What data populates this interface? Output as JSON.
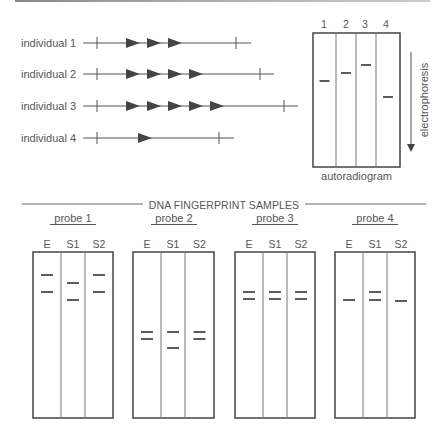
{
  "top_bar": {
    "color": "#999999"
  },
  "genotypes": {
    "rows": [
      {
        "label": "individual 1",
        "y": 43,
        "repeats": 3,
        "tick_start": 97,
        "tick_end": 236,
        "line_end": 251
      },
      {
        "label": "individual 2",
        "y": 74,
        "repeats": 4,
        "tick_start": 97,
        "tick_end": 260,
        "line_end": 274
      },
      {
        "label": "individual 3",
        "y": 106,
        "repeats": 5,
        "tick_start": 97,
        "tick_end": 284,
        "line_end": 298
      },
      {
        "label": "individual 4",
        "y": 138,
        "repeats": 1,
        "tick_start": 97,
        "tick_end": 219,
        "line_end": 234
      }
    ]
  },
  "autoradiogram": {
    "label": "autoradiogram",
    "lanes": [
      "1",
      "2",
      "3",
      "4"
    ],
    "band_y": [
      81,
      73,
      65,
      97
    ],
    "electrophoresis_label": "electrophoresis"
  },
  "samples": {
    "title": "DNA FINGERPRINT SAMPLES",
    "columns": [
      "E",
      "S1",
      "S2"
    ],
    "probes": [
      {
        "label": "probe 1",
        "bands": [
          [
            275,
            292
          ],
          [
            283,
            300
          ],
          [
            275,
            292
          ]
        ]
      },
      {
        "label": "probe 2",
        "bands": [
          [
            332,
            339
          ],
          [
            332,
            348
          ],
          [
            332,
            339
          ]
        ]
      },
      {
        "label": "probe 3",
        "bands": [
          [
            292,
            299
          ],
          [
            292,
            299
          ],
          [
            292,
            299
          ]
        ]
      },
      {
        "label": "probe 4",
        "bands": [
          [
            300
          ],
          [
            292,
            300
          ],
          [
            301
          ]
        ]
      }
    ]
  }
}
